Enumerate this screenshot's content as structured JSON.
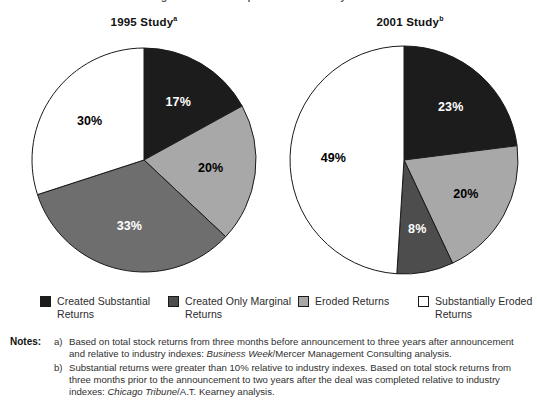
{
  "exhibit": {
    "top_title_partial": "Merger Returns Compared with Industry Indexes"
  },
  "charts": [
    {
      "id": "1995",
      "heading": "1995 Study",
      "heading_superscript": "a"
    },
    {
      "id": "2001",
      "heading": "2001 Study",
      "heading_superscript": "b"
    }
  ],
  "chart_data": [
    {
      "type": "pie",
      "title": "1995 Study",
      "footnote_marker": "a",
      "categories": [
        "Created Substantial Returns",
        "Eroded Returns",
        "Created Only Marginal Returns",
        "Substantially Eroded Returns"
      ],
      "values": [
        17,
        20,
        33,
        30
      ],
      "labels": [
        "17%",
        "20%",
        "33%",
        "30%"
      ],
      "colors": [
        "#1c1c1c",
        "#a8a8a8",
        "#6e6e6e",
        "#ffffff"
      ],
      "start_angle_deg": 0,
      "direction": "clockwise",
      "units": "percent",
      "legend_position": "bottom"
    },
    {
      "type": "pie",
      "title": "2001 Study",
      "footnote_marker": "b",
      "categories": [
        "Created Substantial Returns",
        "Eroded Returns",
        "Created Only Marginal Returns",
        "Substantially Eroded Returns"
      ],
      "values": [
        23,
        20,
        8,
        49
      ],
      "labels": [
        "23%",
        "20%",
        "8%",
        "49%"
      ],
      "colors": [
        "#1c1c1c",
        "#a8a8a8",
        "#4d4d4d",
        "#ffffff"
      ],
      "start_angle_deg": 0,
      "direction": "clockwise",
      "units": "percent",
      "legend_position": "bottom"
    }
  ],
  "legend": {
    "items": [
      {
        "label": "Created Substantial Returns",
        "swatch": "black",
        "color": "#1c1c1c"
      },
      {
        "label": "Created Only Marginal Returns",
        "swatch": "dark",
        "color": "#4d4d4d"
      },
      {
        "label": "Eroded Returns",
        "swatch": "light",
        "color": "#a8a8a8"
      },
      {
        "label": "Substantially Eroded Returns",
        "swatch": "white",
        "color": "#ffffff"
      }
    ]
  },
  "notes": {
    "label": "Notes:",
    "items": [
      {
        "marker": "a)",
        "segments": [
          {
            "text": "Based on total stock returns from three months before announcement to three years after announcement and relative to industry indexes: ",
            "italic": false
          },
          {
            "text": "Business Week",
            "italic": true
          },
          {
            "text": "/Mercer Management Consulting analysis.",
            "italic": false
          }
        ]
      },
      {
        "marker": "b)",
        "segments": [
          {
            "text": "Substantial returns were greater than 10% relative to industry indexes. Based on total stock returns from three months prior to the announcement to two years after the deal was completed relative to industry indexes: ",
            "italic": false
          },
          {
            "text": "Chicago Tribune",
            "italic": true
          },
          {
            "text": "/A.T. Kearney analysis.",
            "italic": false
          }
        ]
      }
    ]
  }
}
